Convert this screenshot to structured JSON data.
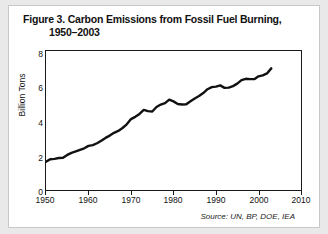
{
  "figure": {
    "title_line1": "Figure 3. Carbon Emissions from Fossil Fuel Burning,",
    "title_line2": "1950–2003",
    "source_note": "Source: UN, BP, DOE, IEA"
  },
  "chart_data": {
    "type": "line",
    "title": "Figure 3. Carbon Emissions from Fossil Fuel Burning, 1950–2003",
    "xlabel": "",
    "ylabel": "Billion Tons",
    "xlim": [
      1950,
      2010
    ],
    "ylim": [
      0,
      8
    ],
    "xticks": [
      1950,
      1960,
      1970,
      1980,
      1990,
      2000,
      2010
    ],
    "yticks": [
      0,
      2,
      4,
      6,
      8
    ],
    "grid": false,
    "legend": false,
    "line_color": "#111111",
    "line_width": 2.4,
    "annotations": [
      "Source: UN, BP, DOE, IEA"
    ],
    "x": [
      1950,
      1951,
      1952,
      1953,
      1954,
      1955,
      1956,
      1957,
      1958,
      1959,
      1960,
      1961,
      1962,
      1963,
      1964,
      1965,
      1966,
      1967,
      1968,
      1969,
      1970,
      1971,
      1972,
      1973,
      1974,
      1975,
      1976,
      1977,
      1978,
      1979,
      1980,
      1981,
      1982,
      1983,
      1984,
      1985,
      1986,
      1987,
      1988,
      1989,
      1990,
      1991,
      1992,
      1993,
      1994,
      1995,
      1996,
      1997,
      1998,
      1999,
      2000,
      2001,
      2002,
      2003
    ],
    "y": [
      1.63,
      1.77,
      1.79,
      1.84,
      1.86,
      2.02,
      2.14,
      2.22,
      2.31,
      2.4,
      2.54,
      2.58,
      2.69,
      2.84,
      3.0,
      3.13,
      3.29,
      3.4,
      3.57,
      3.78,
      4.08,
      4.21,
      4.38,
      4.61,
      4.54,
      4.52,
      4.78,
      4.92,
      5.0,
      5.2,
      5.1,
      4.95,
      4.92,
      4.93,
      5.11,
      5.27,
      5.41,
      5.58,
      5.8,
      5.92,
      5.95,
      6.02,
      5.88,
      5.89,
      5.98,
      6.12,
      6.32,
      6.4,
      6.38,
      6.38,
      6.54,
      6.6,
      6.71,
      7.0
    ]
  },
  "axes": {
    "y_tick_labels": [
      "8",
      "6",
      "4",
      "2",
      "0"
    ],
    "x_tick_labels": [
      "1950",
      "1960",
      "1970",
      "1980",
      "1990",
      "2000",
      "2010"
    ],
    "y_axis_title": "Billion Tons"
  }
}
